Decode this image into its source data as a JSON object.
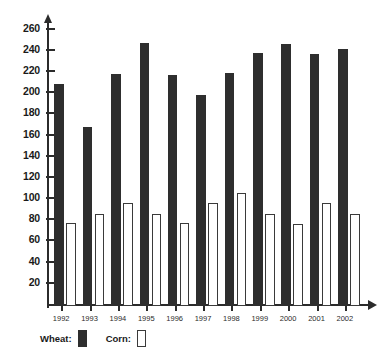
{
  "chart_data": {
    "type": "bar",
    "title": "",
    "subtitle": "",
    "xlabel": "",
    "ylabel": "",
    "categories": [
      "1992",
      "1993",
      "1994",
      "1995",
      "1996",
      "1997",
      "1998",
      "1999",
      "2000",
      "2001",
      "2002"
    ],
    "series": [
      {
        "name": "Wheat",
        "color": "#2e2e2e",
        "values": [
          210,
          169,
          219,
          248,
          218,
          199,
          220,
          239,
          247,
          238,
          243
        ]
      },
      {
        "name": "Corn",
        "color": "#ffffff",
        "values": [
          78,
          87,
          97,
          87,
          78,
          97,
          107,
          87,
          77,
          97,
          87
        ]
      }
    ],
    "ylim": [
      0,
      270
    ],
    "ytick_values": [
      20,
      40,
      60,
      80,
      100,
      120,
      140,
      160,
      180,
      200,
      220,
      240,
      260
    ],
    "ytick_labels": [
      "20",
      "40",
      "60",
      "80",
      "100",
      "120",
      "140",
      "160",
      "180",
      "200",
      "220",
      "240",
      "260"
    ],
    "grid": false,
    "legend_position": "bottom-left"
  },
  "legend": {
    "wheat_label": "Wheat:",
    "corn_label": "Corn:"
  }
}
